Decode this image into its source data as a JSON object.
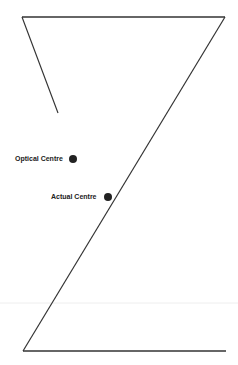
{
  "diagram": {
    "labels": {
      "optical_centre": "Optical Centre",
      "actual_centre": "Actual Centre"
    },
    "colors": {
      "line": "#333333",
      "dot": "#222222",
      "faint_line": "#eeeeee"
    }
  }
}
